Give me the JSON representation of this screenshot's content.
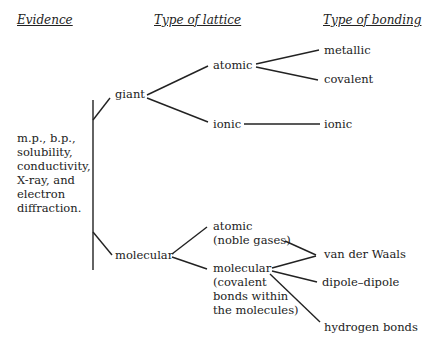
{
  "headers": {
    "evidence": "Evidence",
    "lattice": "Type of lattice",
    "bonding": "Type of bonding"
  },
  "evidence_lines": [
    "m.p., b.p.,",
    "solubility,",
    "conductivity,",
    "X-ray, and",
    "electron",
    "diffraction."
  ],
  "lattice": {
    "giant": "giant",
    "molecular": "molecular",
    "giant_atomic": "atomic",
    "giant_ionic": "ionic",
    "mol_atomic": [
      "atomic",
      "(noble gases)"
    ],
    "mol_molecular": [
      "molecular",
      "(covalent",
      "bonds within",
      "the molecules)"
    ]
  },
  "bonding": {
    "metallic": "metallic",
    "covalent": "covalent",
    "ionic": "ionic",
    "van_der_waals": "van der Waals",
    "dipole": "dipole–dipole",
    "hydrogen": "hydrogen bonds"
  }
}
